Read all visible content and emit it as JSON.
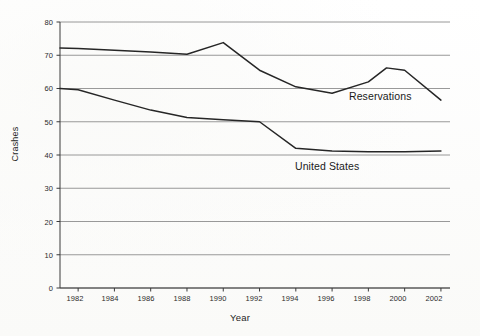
{
  "chart_data": {
    "type": "line",
    "title": "",
    "xlabel": "Year",
    "ylabel": "Crashes",
    "xlim": [
      1981,
      2002.5
    ],
    "ylim": [
      0,
      80
    ],
    "grid": true,
    "legend_position": "inline-annotations",
    "x_ticks": [
      1982,
      1984,
      1986,
      1988,
      1990,
      1992,
      1994,
      1996,
      1998,
      2000,
      2002
    ],
    "y_ticks": [
      0,
      10,
      20,
      30,
      40,
      50,
      60,
      70,
      80
    ],
    "x": [
      1981,
      1982,
      1984,
      1986,
      1988,
      1990,
      1992,
      1994,
      1996,
      1998,
      1999,
      2000,
      2002
    ],
    "series": [
      {
        "name": "Reservations",
        "color": "#262626",
        "values": [
          72.2,
          72.0,
          71.5,
          71.0,
          70.3,
          73.8,
          65.5,
          60.5,
          58.6,
          62.0,
          66.2,
          65.5,
          56.5
        ]
      },
      {
        "name": "United States",
        "color": "#262626",
        "values": [
          60.0,
          59.6,
          56.5,
          53.5,
          51.3,
          50.6,
          50.0,
          42.0,
          41.2,
          41.0,
          41.0,
          41.0,
          41.2
        ]
      }
    ],
    "annotations": [
      {
        "text": "Reservations",
        "x": 1996.8,
        "y": 58.0
      },
      {
        "text": "United States",
        "x": 1994.2,
        "y": 37.0
      }
    ]
  },
  "axes": {
    "y_tick_labels": [
      "80",
      "70",
      "60",
      "50",
      "40",
      "30",
      "20",
      "10",
      "0"
    ],
    "x_tick_labels": [
      "1982",
      "1984",
      "1986",
      "1988",
      "1990",
      "1992",
      "1994",
      "1996",
      "1998",
      "2000",
      "2002"
    ],
    "y_axis_title": "Crashes",
    "x_axis_title": "Year"
  },
  "style": {
    "gridline_color": "#8d8d8d",
    "axis_color": "#3a3a3a",
    "line_color": "#262626",
    "background": "#fdfdfc"
  }
}
